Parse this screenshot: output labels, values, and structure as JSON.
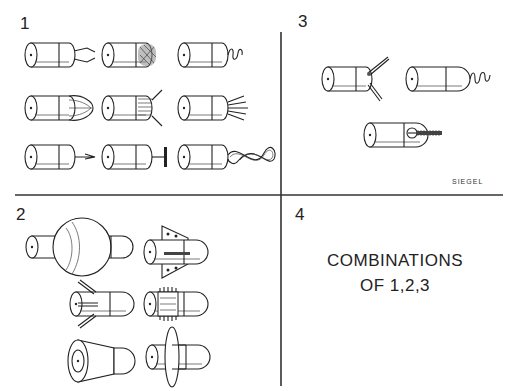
{
  "figure": {
    "signature": "SIEGEL",
    "quadrants": [
      {
        "id": "1",
        "label": "1",
        "description": "Cylinder tips with 9 end attachments: pincer, mesh, coil, loops, splayed prongs, bristles, hook, T-bar, twisted loop"
      },
      {
        "id": "2",
        "label": "2",
        "description": "Capsule bodies with mid attachments: sphere, fins, side prongs, toothed ring, cone, disc"
      },
      {
        "id": "3",
        "label": "3",
        "description": "Cylinder tips with side attachments: V-prongs, corkscrew, threaded screw"
      },
      {
        "id": "4",
        "label": "4",
        "text_line1": "COMBINATIONS",
        "text_line2": "OF 1,2,3"
      }
    ]
  },
  "colors": {
    "ink": "#222222",
    "background": "#ffffff"
  }
}
